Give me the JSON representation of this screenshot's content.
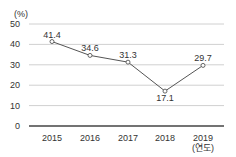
{
  "chart_data": {
    "type": "line",
    "title": "",
    "xlabel": "(연도)",
    "ylabel": "(%)",
    "categories": [
      "2015",
      "2016",
      "2017",
      "2018",
      "2019"
    ],
    "values": [
      41.4,
      34.6,
      31.3,
      17.1,
      29.7
    ],
    "data_labels": [
      "41.4",
      "34.6",
      "31.3",
      "17.1",
      "29.7"
    ],
    "yticks": [
      0,
      10,
      20,
      30,
      40,
      50
    ],
    "ylim": [
      0,
      50
    ],
    "grid": true,
    "legend": null,
    "colors": {
      "line": "#555555",
      "grid": "#d0d0d0",
      "axis": "#444444",
      "marker_fill": "#ffffff"
    }
  }
}
